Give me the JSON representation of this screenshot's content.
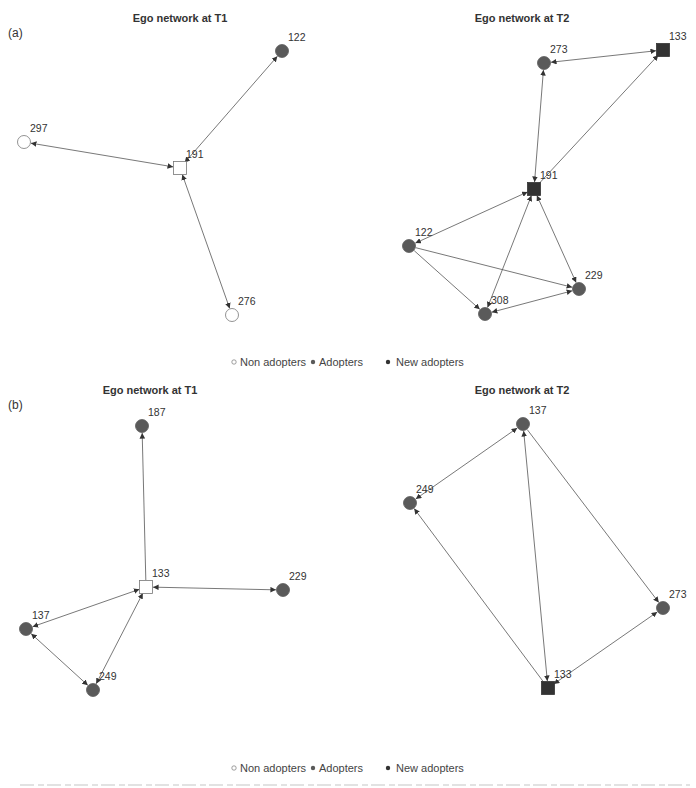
{
  "figure": {
    "panels": [
      {
        "tag": "(a)",
        "networks": [
          {
            "title": "Ego network at T1",
            "nodes": [
              {
                "id": "191",
                "x": 180,
                "y": 168,
                "shape": "square",
                "status": "non-adopter",
                "ego": true
              },
              {
                "id": "122",
                "x": 282,
                "y": 51,
                "shape": "circle",
                "status": "adopter"
              },
              {
                "id": "297",
                "x": 24,
                "y": 142,
                "shape": "circle",
                "status": "non-adopter"
              },
              {
                "id": "276",
                "x": 232,
                "y": 315,
                "shape": "circle",
                "status": "non-adopter"
              }
            ],
            "edges": [
              {
                "from": "191",
                "to": "122",
                "bidirectional": true
              },
              {
                "from": "191",
                "to": "297",
                "bidirectional": true
              },
              {
                "from": "191",
                "to": "276",
                "bidirectional": true
              }
            ]
          },
          {
            "title": "Ego network at T2",
            "nodes": [
              {
                "id": "191",
                "x": 534,
                "y": 189,
                "shape": "square",
                "status": "new-adopter",
                "ego": true
              },
              {
                "id": "133",
                "x": 663,
                "y": 50,
                "shape": "square",
                "status": "new-adopter"
              },
              {
                "id": "273",
                "x": 544,
                "y": 63,
                "shape": "circle",
                "status": "adopter"
              },
              {
                "id": "122",
                "x": 409,
                "y": 246,
                "shape": "circle",
                "status": "adopter"
              },
              {
                "id": "229",
                "x": 579,
                "y": 289,
                "shape": "circle",
                "status": "adopter"
              },
              {
                "id": "308",
                "x": 485,
                "y": 314,
                "shape": "circle",
                "status": "adopter"
              }
            ],
            "edges": [
              {
                "from": "273",
                "to": "133",
                "bidirectional": true
              },
              {
                "from": "191",
                "to": "133",
                "bidirectional": false
              },
              {
                "from": "191",
                "to": "273",
                "bidirectional": true
              },
              {
                "from": "191",
                "to": "122",
                "bidirectional": true
              },
              {
                "from": "191",
                "to": "308",
                "bidirectional": true
              },
              {
                "from": "191",
                "to": "229",
                "bidirectional": true
              },
              {
                "from": "122",
                "to": "308",
                "bidirectional": false
              },
              {
                "from": "122",
                "to": "229",
                "bidirectional": false
              },
              {
                "from": "308",
                "to": "229",
                "bidirectional": true
              }
            ]
          }
        ],
        "legend": [
          "Non adopters",
          "Adopters",
          "New adopters"
        ]
      },
      {
        "tag": "(b)",
        "networks": [
          {
            "title": "Ego network at T1",
            "nodes": [
              {
                "id": "133",
                "x": 146,
                "y": 587,
                "shape": "square",
                "status": "non-adopter",
                "ego": true
              },
              {
                "id": "187",
                "x": 142,
                "y": 426,
                "shape": "circle",
                "status": "adopter"
              },
              {
                "id": "229",
                "x": 283,
                "y": 590,
                "shape": "circle",
                "status": "adopter"
              },
              {
                "id": "137",
                "x": 26,
                "y": 629,
                "shape": "circle",
                "status": "adopter"
              },
              {
                "id": "249",
                "x": 93,
                "y": 690,
                "shape": "circle",
                "status": "adopter"
              }
            ],
            "edges": [
              {
                "from": "133",
                "to": "187",
                "bidirectional": false
              },
              {
                "from": "133",
                "to": "229",
                "bidirectional": true
              },
              {
                "from": "133",
                "to": "137",
                "bidirectional": true
              },
              {
                "from": "133",
                "to": "249",
                "bidirectional": true
              },
              {
                "from": "137",
                "to": "249",
                "bidirectional": true
              }
            ]
          },
          {
            "title": "Ego network at T2",
            "nodes": [
              {
                "id": "133",
                "x": 548,
                "y": 688,
                "shape": "square",
                "status": "new-adopter",
                "ego": true
              },
              {
                "id": "137",
                "x": 523,
                "y": 424,
                "shape": "circle",
                "status": "adopter"
              },
              {
                "id": "249",
                "x": 410,
                "y": 503,
                "shape": "circle",
                "status": "adopter"
              },
              {
                "id": "273",
                "x": 663,
                "y": 608,
                "shape": "circle",
                "status": "adopter"
              }
            ],
            "edges": [
              {
                "from": "249",
                "to": "137",
                "bidirectional": true
              },
              {
                "from": "133",
                "to": "137",
                "bidirectional": true
              },
              {
                "from": "137",
                "to": "273",
                "bidirectional": false
              },
              {
                "from": "133",
                "to": "249",
                "bidirectional": false
              },
              {
                "from": "133",
                "to": "273",
                "bidirectional": true
              }
            ]
          }
        ],
        "legend": [
          "Non adopters",
          "Adopters",
          "New adopters"
        ]
      }
    ],
    "colors": {
      "adopter_fill": "#5a5a5a",
      "new_adopter_fill": "#333333",
      "non_adopter_fill": "#ffffff",
      "outline": "#777777",
      "edge": "#555555"
    }
  },
  "layout": {
    "titles": [
      {
        "x": 110,
        "y": 22
      },
      {
        "x": 522,
        "y": 22
      },
      {
        "x": 150,
        "y": 394
      },
      {
        "x": 522,
        "y": 394
      }
    ],
    "tags": [
      {
        "x": 8,
        "y": 37
      },
      {
        "x": 8,
        "y": 409
      }
    ],
    "legends": [
      {
        "x": 230,
        "y": 366
      },
      {
        "x": 230,
        "y": 772
      }
    ]
  }
}
